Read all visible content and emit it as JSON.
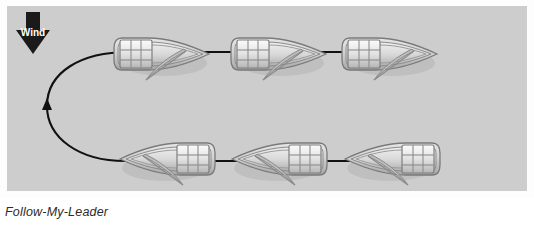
{
  "figure": {
    "caption": "Follow-My-Leader",
    "panel_background": "#cdcdcd",
    "frame_background": "#fdfdfd",
    "line_color": "#111111",
    "caption_color": "#2b2b2b"
  },
  "wind": {
    "label": "Wind",
    "direction": "down",
    "arrow_color": "#1a1a1a",
    "label_color": "#ffffff"
  },
  "boats": [
    {
      "id": "boat-top-1",
      "row": "top",
      "heading": "right",
      "x": 155,
      "y": 48
    },
    {
      "id": "boat-top-2",
      "row": "top",
      "heading": "right",
      "x": 272,
      "y": 48
    },
    {
      "id": "boat-top-3",
      "row": "top",
      "heading": "right",
      "x": 383,
      "y": 48
    },
    {
      "id": "boat-bottom-1",
      "row": "bottom",
      "heading": "left",
      "x": 160,
      "y": 153
    },
    {
      "id": "boat-bottom-2",
      "row": "bottom",
      "heading": "left",
      "x": 272,
      "y": 153
    },
    {
      "id": "boat-bottom-3",
      "row": "bottom",
      "heading": "left",
      "x": 385,
      "y": 153
    }
  ],
  "path_arrows": [
    {
      "id": "arrow-top-1",
      "direction": "right",
      "from_x": 190,
      "to_x": 240,
      "y": 46
    },
    {
      "id": "arrow-top-2",
      "direction": "right",
      "from_x": 305,
      "to_x": 352,
      "y": 46
    },
    {
      "id": "arrow-bottom-1",
      "direction": "left",
      "from_x": 345,
      "to_x": 300,
      "y": 155
    },
    {
      "id": "arrow-bottom-2",
      "direction": "left",
      "from_x": 232,
      "to_x": 188,
      "y": 155
    },
    {
      "id": "arrow-turn",
      "direction": "up",
      "x": 48,
      "y": 100
    }
  ],
  "turn_path": {
    "description": "curved leftward turn joining bottom row to top row",
    "start_x": 118,
    "start_y": 155,
    "end_x": 122,
    "end_y": 46,
    "apex_x": 47
  },
  "colors": {
    "hull_light": "#e9e9e9",
    "hull_mid": "#c2c2c2",
    "hull_dark": "#8f8f8f",
    "hull_outline": "#6e6e6e",
    "cabin_light": "#f2f2f2",
    "cabin_mid": "#cfcfcf",
    "cabin_dark": "#9a9a9a",
    "sail": "#b5b5b5",
    "shadow": "#a8a8a8"
  }
}
